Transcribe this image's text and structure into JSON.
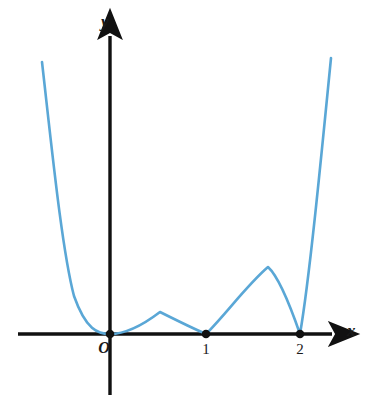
{
  "figure": {
    "kind": "cartesian-function-plot",
    "background_color": "#ffffff",
    "axis_color": "#111111",
    "curve_color": "#5aa7d6",
    "marker_color": "#111111"
  },
  "axes": {
    "x_axis": {
      "label": "x",
      "arrow": true,
      "pixel_y": 334,
      "pixel_x_start": 18,
      "pixel_x_end": 340
    },
    "y_axis": {
      "label": "y",
      "arrow": true,
      "pixel_x": 110,
      "pixel_y_start": 395,
      "pixel_y_end": 28
    }
  },
  "tick_labels": [
    {
      "text": "O",
      "value": 0,
      "role": "origin",
      "x": 103,
      "y": 341
    },
    {
      "text": "1",
      "value": 1,
      "role": "x-tick",
      "x": 201,
      "y": 341
    },
    {
      "text": "2",
      "value": 2,
      "role": "x-tick",
      "x": 295,
      "y": 341
    }
  ],
  "markers": [
    {
      "name": "point-origin",
      "x_value": 0,
      "y_value": 0,
      "px": 110,
      "py": 334
    },
    {
      "name": "point-one",
      "x_value": 1,
      "y_value": 0,
      "px": 206,
      "py": 334
    },
    {
      "name": "point-two",
      "x_value": 2,
      "y_value": 0,
      "px": 300,
      "py": 334
    }
  ],
  "chart_data": {
    "type": "line",
    "title": "",
    "xlabel": "x",
    "ylabel": "y",
    "grid": false,
    "legend": false,
    "x_tick_values": [
      0,
      1,
      2
    ],
    "x_tick_labels": [
      "O",
      "1",
      "2"
    ],
    "y_tick_values": [],
    "y_tick_labels": [],
    "xlim": [
      -0.72,
      2.4
    ],
    "ylim": [
      0,
      2.9
    ],
    "origin_px": {
      "x": 110,
      "y": 334
    },
    "scale_px_per_unit": {
      "x": 95,
      "y": 95
    },
    "series": [
      {
        "name": "y = |x^2(x-1)(x-2)|",
        "color": "#5aa7d6",
        "linewidth": 2.6,
        "roots": [
          {
            "x": 0,
            "multiplicity": 2,
            "shape": "tangent"
          },
          {
            "x": 1,
            "multiplicity": 1,
            "shape": "cusp"
          },
          {
            "x": 2,
            "multiplicity": 1,
            "shape": "cusp"
          }
        ],
        "local_maxima": [
          {
            "x": 0.4,
            "y": 0.23
          },
          {
            "x": 1.66,
            "y": 0.7
          }
        ],
        "path_px": "M 42,62 C 52,150 62,250 74,296 C 86,330 98,334 110,334 C 126,334 143,325 160,312 C 176,320 192,328 206,334 C 226,314 247,285 268,267 C 279,277 290,305 300,334 C 309,282 320,170 331,58"
      }
    ],
    "annotations": [
      {
        "text": "x",
        "role": "axis-name",
        "px": 352,
        "py": 331
      },
      {
        "text": "y",
        "role": "axis-name",
        "px": 106,
        "py": 22
      }
    ]
  }
}
